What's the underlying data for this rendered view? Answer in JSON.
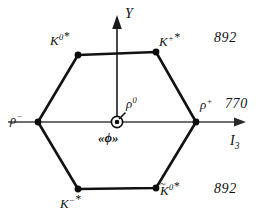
{
  "figure": {
    "background_color": "#ffffff",
    "line_color": "#111111",
    "axis_color": "#3a3a3a"
  },
  "axes": {
    "vertical": {
      "label": "Y",
      "name": "hypercharge-axis"
    },
    "horizontal": {
      "label_main": "I",
      "label_sub": "3",
      "name": "isospin-axis"
    }
  },
  "center": {
    "symbol": "circled-dot",
    "omega_rho_label": {
      "base": "ρ",
      "sup": "0"
    },
    "phi_label": "«ϕ»"
  },
  "vertices": [
    {
      "id": "K0star",
      "base": "K",
      "sup": "0",
      "star": "*",
      "tilde": false,
      "x": 78,
      "y": 55
    },
    {
      "id": "Kplusstar",
      "base": "K",
      "sup": "+",
      "star": "*",
      "tilde": false,
      "x": 156,
      "y": 52
    },
    {
      "id": "rhoplus",
      "base": "ρ",
      "sup": "+",
      "star": "",
      "tilde": false,
      "x": 196,
      "y": 122
    },
    {
      "id": "antiK0star",
      "base": "K",
      "sup": "0",
      "star": "*",
      "tilde": true,
      "x": 156,
      "y": 188
    },
    {
      "id": "Kminusstar",
      "base": "K",
      "sup": "−",
      "star": "*",
      "tilde": false,
      "x": 78,
      "y": 189
    },
    {
      "id": "rhominus",
      "base": "ρ",
      "sup": "−",
      "star": "",
      "tilde": false,
      "x": 38,
      "y": 122
    }
  ],
  "masses": {
    "top": "892",
    "middle": "770",
    "bottom": "892"
  },
  "labels": {
    "K0star": {
      "base": "K",
      "sup": "0",
      "star": "*"
    },
    "Kplusstar": {
      "base": "K",
      "sup": "+",
      "star": "*"
    },
    "Kminusstar": {
      "base": "K",
      "sup": "−",
      "star": "*"
    },
    "antiK0star": {
      "base": "K",
      "tilde": "~",
      "sup": "0",
      "star": "*"
    },
    "rhominus": {
      "base": "ρ",
      "sup": "−"
    },
    "rhoplus": {
      "base": "ρ",
      "sup": "+"
    },
    "rho0": {
      "base": "ρ",
      "sup": "0"
    }
  }
}
